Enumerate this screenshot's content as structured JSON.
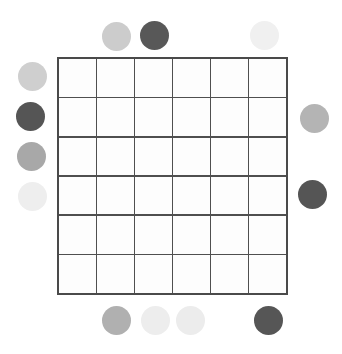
{
  "canvas": {
    "width": 342,
    "height": 354,
    "background": "#ffffff"
  },
  "board": {
    "name": "grid-board",
    "rows": 6,
    "columns": 6,
    "cell_count": 36,
    "left": 57,
    "top": 57,
    "width": 231,
    "height": 238,
    "line_color": "#4f4f4f",
    "line_width": 1.6,
    "outer_border_color": "#4a4a4a",
    "outer_border_width": 2,
    "cell_fill": "#fdfdfd",
    "cells": [
      {
        "row": 1,
        "col": 1,
        "label": ""
      },
      {
        "row": 1,
        "col": 2,
        "label": ""
      },
      {
        "row": 1,
        "col": 3,
        "label": ""
      },
      {
        "row": 1,
        "col": 4,
        "label": ""
      },
      {
        "row": 1,
        "col": 5,
        "label": ""
      },
      {
        "row": 1,
        "col": 6,
        "label": ""
      },
      {
        "row": 2,
        "col": 1,
        "label": ""
      },
      {
        "row": 2,
        "col": 2,
        "label": ""
      },
      {
        "row": 2,
        "col": 3,
        "label": ""
      },
      {
        "row": 2,
        "col": 4,
        "label": ""
      },
      {
        "row": 2,
        "col": 5,
        "label": ""
      },
      {
        "row": 2,
        "col": 6,
        "label": ""
      },
      {
        "row": 3,
        "col": 1,
        "label": ""
      },
      {
        "row": 3,
        "col": 2,
        "label": ""
      },
      {
        "row": 3,
        "col": 3,
        "label": ""
      },
      {
        "row": 3,
        "col": 4,
        "label": ""
      },
      {
        "row": 3,
        "col": 5,
        "label": ""
      },
      {
        "row": 3,
        "col": 6,
        "label": ""
      },
      {
        "row": 4,
        "col": 1,
        "label": ""
      },
      {
        "row": 4,
        "col": 2,
        "label": ""
      },
      {
        "row": 4,
        "col": 3,
        "label": ""
      },
      {
        "row": 4,
        "col": 4,
        "label": ""
      },
      {
        "row": 4,
        "col": 5,
        "label": ""
      },
      {
        "row": 4,
        "col": 6,
        "label": ""
      },
      {
        "row": 5,
        "col": 1,
        "label": ""
      },
      {
        "row": 5,
        "col": 2,
        "label": ""
      },
      {
        "row": 5,
        "col": 3,
        "label": ""
      },
      {
        "row": 5,
        "col": 4,
        "label": ""
      },
      {
        "row": 5,
        "col": 5,
        "label": ""
      },
      {
        "row": 5,
        "col": 6,
        "label": ""
      },
      {
        "row": 6,
        "col": 1,
        "label": ""
      },
      {
        "row": 6,
        "col": 2,
        "label": ""
      },
      {
        "row": 6,
        "col": 3,
        "label": ""
      },
      {
        "row": 6,
        "col": 4,
        "label": ""
      },
      {
        "row": 6,
        "col": 5,
        "label": ""
      },
      {
        "row": 6,
        "col": 6,
        "label": ""
      }
    ]
  },
  "tokens": {
    "count": 13,
    "diameter": 28,
    "items": [
      {
        "id": "token-top-1",
        "side": "top",
        "cx": 116,
        "cy": 36,
        "d": 29,
        "color": "#cccccc",
        "shade": "light-gray"
      },
      {
        "id": "token-top-2",
        "side": "top",
        "cx": 154,
        "cy": 35,
        "d": 29,
        "color": "#585858",
        "shade": "dark-gray"
      },
      {
        "id": "token-top-3",
        "side": "top",
        "cx": 264,
        "cy": 35,
        "d": 29,
        "color": "#f0f0f0",
        "shade": "near-white"
      },
      {
        "id": "token-left-1",
        "side": "left",
        "cx": 32,
        "cy": 76,
        "d": 29,
        "color": "#cfcfcf",
        "shade": "light-gray"
      },
      {
        "id": "token-left-2",
        "side": "left",
        "cx": 30,
        "cy": 116,
        "d": 29,
        "color": "#555555",
        "shade": "dark-gray"
      },
      {
        "id": "token-left-3",
        "side": "left",
        "cx": 31,
        "cy": 156,
        "d": 29,
        "color": "#a8a8a8",
        "shade": "medium-gray"
      },
      {
        "id": "token-left-4",
        "side": "left",
        "cx": 32,
        "cy": 196,
        "d": 29,
        "color": "#eeeeee",
        "shade": "near-white"
      },
      {
        "id": "token-right-1",
        "side": "right",
        "cx": 314,
        "cy": 118,
        "d": 29,
        "color": "#b4b4b4",
        "shade": "medium-light-gray"
      },
      {
        "id": "token-right-2",
        "side": "right",
        "cx": 312,
        "cy": 194,
        "d": 29,
        "color": "#555555",
        "shade": "dark-gray"
      },
      {
        "id": "token-bottom-1",
        "side": "bottom",
        "cx": 116,
        "cy": 320,
        "d": 29,
        "color": "#b0b0b0",
        "shade": "medium-gray"
      },
      {
        "id": "token-bottom-2",
        "side": "bottom",
        "cx": 155,
        "cy": 320,
        "d": 29,
        "color": "#ededed",
        "shade": "near-white"
      },
      {
        "id": "token-bottom-3",
        "side": "bottom",
        "cx": 190,
        "cy": 320,
        "d": 29,
        "color": "#ececec",
        "shade": "near-white"
      },
      {
        "id": "token-bottom-4",
        "side": "bottom",
        "cx": 268,
        "cy": 320,
        "d": 29,
        "color": "#565656",
        "shade": "dark-gray"
      }
    ]
  }
}
